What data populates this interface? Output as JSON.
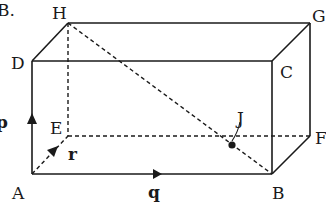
{
  "question_label": "B.",
  "vertices": {
    "A": "A",
    "B": "B",
    "C": "C",
    "D": "D",
    "E": "E",
    "F": "F",
    "G": "G",
    "H": "H"
  },
  "point_label": "J",
  "vectors": {
    "p": "p",
    "q": "q",
    "r": "r"
  },
  "edges_solid": [
    "AB",
    "AD",
    "DC",
    "BC",
    "DH",
    "HG",
    "CG",
    "GF",
    "BF"
  ],
  "edges_dashed": [
    "HE",
    "EF",
    "AE",
    "HB"
  ],
  "colors": {
    "line": "#1a1a1a",
    "background": "#ffffff"
  }
}
